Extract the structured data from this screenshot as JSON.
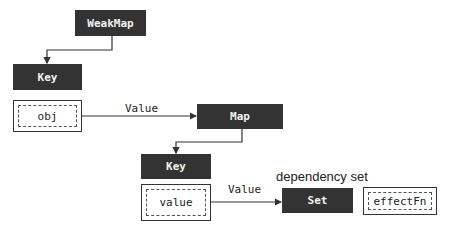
{
  "diagram": {
    "nodes": {
      "weakmap": {
        "label": "WeakMap"
      },
      "key_outer": {
        "label": "Key"
      },
      "obj": {
        "label": "obj"
      },
      "map": {
        "label": "Map"
      },
      "key_inner": {
        "label": "Key"
      },
      "value": {
        "label": "value"
      },
      "set": {
        "label": "Set"
      },
      "effectfn": {
        "label": "effectFn"
      }
    },
    "edges": [
      {
        "from": "WeakMap",
        "to": "Key",
        "label": ""
      },
      {
        "from": "obj",
        "to": "Map",
        "label": "Value"
      },
      {
        "from": "Map",
        "to": "Key",
        "label": ""
      },
      {
        "from": "value",
        "to": "Set",
        "label": "Value"
      }
    ],
    "captions": {
      "set_caption": "dependency set"
    },
    "colors": {
      "box_fill": "#333333",
      "box_text": "#f2f2f2",
      "line": "#333333"
    }
  }
}
